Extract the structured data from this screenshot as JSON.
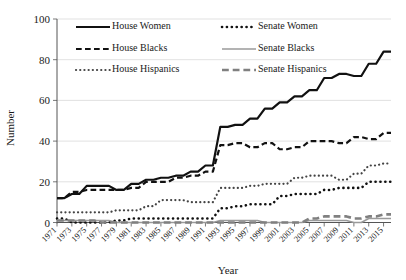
{
  "chart_data": {
    "type": "line",
    "title": "",
    "xlabel": "Year",
    "ylabel": "Number",
    "ylim": [
      0,
      100
    ],
    "yticks": [
      0,
      20,
      40,
      60,
      80,
      100
    ],
    "grid": "horizontal",
    "legend_position": "top-inside",
    "x": [
      1971,
      1972,
      1973,
      1974,
      1975,
      1976,
      1977,
      1978,
      1979,
      1980,
      1981,
      1982,
      1983,
      1984,
      1985,
      1986,
      1987,
      1988,
      1989,
      1990,
      1991,
      1992,
      1993,
      1994,
      1995,
      1996,
      1997,
      1998,
      1999,
      2000,
      2001,
      2002,
      2003,
      2004,
      2005,
      2006,
      2007,
      2008,
      2009,
      2010,
      2011,
      2012,
      2013,
      2014,
      2015,
      2016
    ],
    "xtick_labels": [
      "1971",
      "1973",
      "1975",
      "1977",
      "1979",
      "1981",
      "1983",
      "1985",
      "1987",
      "1989",
      "1991",
      "1993",
      "1995",
      "1997",
      "1999",
      "2001",
      "2003",
      "2005",
      "2007",
      "2009",
      "2011",
      "2013",
      "2015"
    ],
    "series": [
      {
        "name": "House Women",
        "style": "solid",
        "color": "#111111",
        "width": 2.2,
        "values": [
          12,
          12,
          14,
          14,
          18,
          18,
          18,
          18,
          16,
          16,
          19,
          19,
          21,
          21,
          22,
          22,
          23,
          23,
          25,
          25,
          28,
          28,
          47,
          47,
          48,
          48,
          51,
          51,
          56,
          56,
          59,
          59,
          62,
          62,
          65,
          65,
          71,
          71,
          73,
          73,
          72,
          72,
          78,
          78,
          84,
          84
        ]
      },
      {
        "name": "Senate Women",
        "style": "dotted",
        "color": "#111111",
        "width": 2.6,
        "values": [
          2,
          2,
          0,
          0,
          0,
          0,
          0,
          0,
          1,
          1,
          2,
          2,
          2,
          2,
          2,
          2,
          2,
          2,
          2,
          2,
          2,
          2,
          7,
          7,
          8,
          8,
          9,
          9,
          9,
          9,
          13,
          13,
          14,
          14,
          14,
          14,
          16,
          16,
          17,
          17,
          17,
          17,
          20,
          20,
          20,
          20
        ]
      },
      {
        "name": "House Blacks",
        "style": "dashed",
        "color": "#111111",
        "width": 2.2,
        "values": [
          12,
          12,
          15,
          15,
          16,
          16,
          16,
          16,
          16,
          16,
          17,
          17,
          20,
          20,
          20,
          20,
          22,
          22,
          23,
          23,
          25,
          25,
          38,
          38,
          39,
          39,
          37,
          37,
          39,
          39,
          36,
          36,
          37,
          37,
          40,
          40,
          40,
          40,
          39,
          39,
          42,
          42,
          41,
          41,
          44,
          44
        ]
      },
      {
        "name": "Senate Blacks",
        "style": "solid",
        "color": "#9a9a9a",
        "width": 1.6,
        "values": [
          1,
          1,
          1,
          1,
          1,
          1,
          1,
          1,
          0,
          0,
          0,
          0,
          0,
          0,
          0,
          0,
          0,
          0,
          0,
          0,
          0,
          0,
          1,
          1,
          1,
          1,
          1,
          1,
          0,
          0,
          0,
          0,
          0,
          0,
          1,
          1,
          1,
          1,
          1,
          1,
          0,
          0,
          2,
          2,
          2,
          2
        ]
      },
      {
        "name": "House Hispanics",
        "style": "dotted",
        "color": "#444444",
        "width": 2.2,
        "values": [
          5,
          5,
          5,
          5,
          5,
          5,
          5,
          5,
          6,
          6,
          6,
          6,
          8,
          8,
          11,
          11,
          11,
          11,
          10,
          10,
          10,
          10,
          17,
          17,
          17,
          17,
          18,
          18,
          19,
          19,
          19,
          19,
          22,
          22,
          23,
          23,
          23,
          23,
          21,
          21,
          24,
          24,
          28,
          28,
          29,
          29
        ]
      },
      {
        "name": "Senate Hispanics",
        "style": "dashed",
        "color": "#808080",
        "width": 2.6,
        "values": [
          1,
          1,
          1,
          1,
          1,
          1,
          0,
          0,
          0,
          0,
          0,
          0,
          0,
          0,
          0,
          0,
          0,
          0,
          0,
          0,
          0,
          0,
          0,
          0,
          0,
          0,
          0,
          0,
          0,
          0,
          0,
          0,
          0,
          0,
          2,
          2,
          3,
          3,
          3,
          3,
          2,
          2,
          3,
          3,
          4,
          4
        ]
      }
    ]
  },
  "legend": {
    "entries": [
      {
        "label": "House Women",
        "style": "solid",
        "color": "#111111",
        "col": 0,
        "row": 0
      },
      {
        "label": "Senate Women",
        "style": "dotted",
        "color": "#111111",
        "col": 1,
        "row": 0
      },
      {
        "label": "House Blacks",
        "style": "dashed",
        "color": "#111111",
        "col": 0,
        "row": 1
      },
      {
        "label": "Senate Blacks",
        "style": "solid",
        "color": "#9a9a9a",
        "col": 1,
        "row": 1
      },
      {
        "label": "House Hispanics",
        "style": "dotted",
        "color": "#444444",
        "col": 0,
        "row": 2
      },
      {
        "label": "Senate Hispanics",
        "style": "dashed",
        "color": "#808080",
        "col": 1,
        "row": 2
      }
    ]
  },
  "axes": {
    "y_title": "Number",
    "x_title": "Year"
  }
}
